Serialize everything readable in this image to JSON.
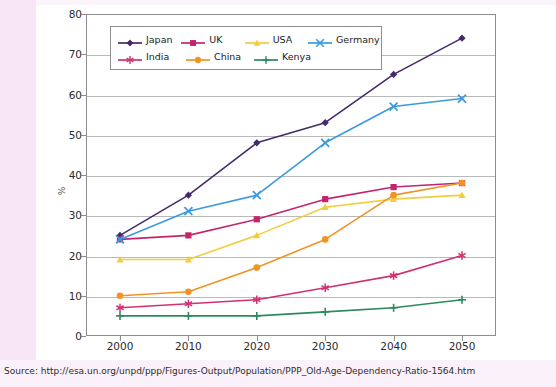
{
  "page": {
    "background_color": "#ffffff",
    "margin_color": "#f8e6f7"
  },
  "source": {
    "label": "Source: http://esa.un.org/unpd/ppp/Figures-Output/Population/PPP_Old-Age-Dependency-Ratio-1564.htm"
  },
  "legend": {
    "position": "inside-top-left",
    "rows": [
      [
        "Japan",
        "UK",
        "USA",
        "Germany"
      ],
      [
        "India",
        "China",
        "Kenya"
      ]
    ]
  },
  "chart_data": {
    "type": "line",
    "title": "",
    "xlabel": "",
    "ylabel": "%",
    "categories": [
      "2000",
      "2010",
      "2020",
      "2030",
      "2040",
      "2050"
    ],
    "x": [
      2000,
      2010,
      2020,
      2030,
      2040,
      2050
    ],
    "xlim": [
      1995,
      2055
    ],
    "ylim": [
      0,
      80
    ],
    "yticks": [
      0,
      10,
      20,
      30,
      40,
      50,
      60,
      70,
      80
    ],
    "ytick_labels": [
      "0",
      "10",
      "20",
      "30",
      "40",
      "50",
      "60",
      "70",
      "80"
    ],
    "grid": true,
    "grid_axis": "y",
    "legend": true,
    "legend_position": "upper left",
    "series": [
      {
        "name": "Japan",
        "color": "#462a6b",
        "marker": "diamond",
        "values": [
          25,
          35,
          48,
          53,
          65,
          74
        ]
      },
      {
        "name": "UK",
        "color": "#c4246d",
        "marker": "square",
        "values": [
          24,
          25,
          29,
          34,
          37,
          38
        ]
      },
      {
        "name": "USA",
        "color": "#f2cd3c",
        "marker": "triangle",
        "values": [
          19,
          19,
          25,
          32,
          34,
          35
        ]
      },
      {
        "name": "Germany",
        "color": "#3b9ade",
        "marker": "x",
        "values": [
          24,
          31,
          35,
          48,
          57,
          59
        ]
      },
      {
        "name": "India",
        "color": "#cf3173",
        "marker": "asterisk",
        "values": [
          7,
          8,
          9,
          12,
          15,
          20
        ]
      },
      {
        "name": "China",
        "color": "#f39324",
        "marker": "circle",
        "values": [
          10,
          11,
          17,
          24,
          35,
          38
        ]
      },
      {
        "name": "Kenya",
        "color": "#2c8a5e",
        "marker": "plus",
        "values": [
          5,
          5,
          5,
          6,
          7,
          9
        ]
      }
    ]
  }
}
